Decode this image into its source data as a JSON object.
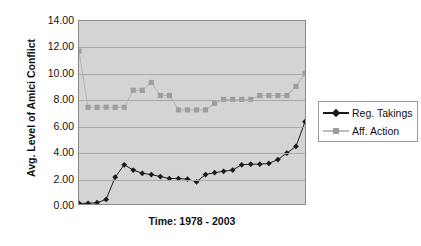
{
  "chart_data": {
    "type": "line",
    "title": "",
    "xlabel": "Time: 1978 - 2003",
    "ylabel": "Avg. Level of Amici Conflict",
    "ylim": [
      0,
      14
    ],
    "ytick_labels": [
      "14.00",
      "12.00",
      "10.00",
      "8.00",
      "6.00",
      "4.00",
      "2.00",
      "0.00"
    ],
    "ytick_values": [
      14,
      12,
      10,
      8,
      6,
      4,
      2,
      0
    ],
    "ystep": 2,
    "grid": true,
    "grid_color": "#a9a9a9",
    "plot_background": "#d4d4d4",
    "legend_position": "right",
    "x": [
      1978,
      1979,
      1980,
      1981,
      1982,
      1983,
      1984,
      1985,
      1986,
      1987,
      1988,
      1989,
      1990,
      1991,
      1992,
      1993,
      1994,
      1995,
      1996,
      1997,
      1998,
      1999,
      2000,
      2001,
      2002,
      2003
    ],
    "xtick_labels": [],
    "series": [
      {
        "name": "Reg. Takings",
        "color": "#1a1a1a",
        "marker": "diamond",
        "values": [
          0.05,
          0.05,
          0.1,
          0.35,
          2.05,
          3.0,
          2.6,
          2.35,
          2.25,
          2.1,
          1.95,
          1.95,
          1.9,
          1.7,
          2.25,
          2.4,
          2.5,
          2.6,
          3.0,
          3.05,
          3.05,
          3.1,
          3.4,
          3.9,
          4.4,
          6.3
        ]
      },
      {
        "name": "Aff. Action",
        "color": "#9e9e9e",
        "marker": "square",
        "values": [
          11.7,
          7.4,
          7.4,
          7.4,
          7.4,
          7.4,
          8.7,
          8.7,
          9.3,
          8.3,
          8.3,
          7.2,
          7.2,
          7.2,
          7.2,
          7.7,
          8.0,
          8.0,
          8.0,
          8.0,
          8.3,
          8.3,
          8.3,
          8.3,
          9.0,
          10.0
        ]
      }
    ]
  },
  "legend": {
    "items": [
      {
        "label": "Reg. Takings"
      },
      {
        "label": "Aff. Action"
      }
    ]
  },
  "caption": {
    "text": ""
  }
}
